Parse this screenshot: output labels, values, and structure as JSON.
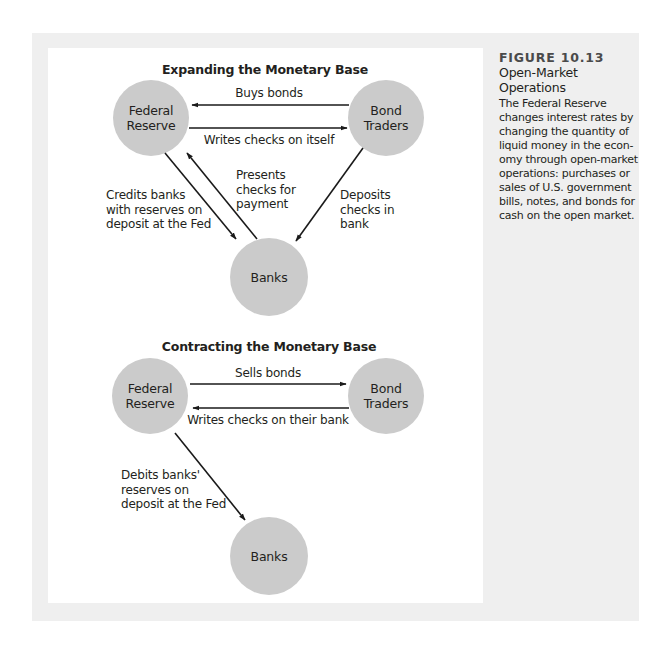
{
  "caption": {
    "figure_number": "FIGURE 10.13",
    "title_lines": [
      "Open-Market",
      "Operations"
    ],
    "body_lines": [
      "The Federal Reserve",
      "changes interest rates by",
      "changing the quantity of",
      "liquid money in the econ-",
      "omy through open-market",
      "operations: purchases or",
      "sales of U.S. government",
      "bills, notes, and bonds for",
      "cash on the open market."
    ]
  },
  "expanding": {
    "title": "Expanding the Monetary Base",
    "nodes": {
      "fed": [
        "Federal",
        "Reserve"
      ],
      "traders": [
        "Bond",
        "Traders"
      ],
      "banks": [
        "Banks"
      ]
    },
    "edges": {
      "buys_bonds": "Buys bonds",
      "writes_checks": "Writes checks on itself",
      "credits_banks": [
        "Credits banks",
        "with reserves on",
        "deposit at the Fed"
      ],
      "presents_checks": [
        "Presents",
        "checks for",
        "payment"
      ],
      "deposits_checks": [
        "Deposits",
        "checks in",
        "bank"
      ]
    }
  },
  "contracting": {
    "title": "Contracting the Monetary Base",
    "nodes": {
      "fed": [
        "Federal",
        "Reserve"
      ],
      "traders": [
        "Bond",
        "Traders"
      ],
      "banks": [
        "Banks"
      ]
    },
    "edges": {
      "sells_bonds": "Sells bonds",
      "writes_checks": "Writes checks on their bank",
      "debits_banks": [
        "Debits banks'",
        "reserves on",
        "deposit at the Fed"
      ]
    }
  },
  "colors": {
    "panel": "#efefef",
    "node_fill": "#cbcbcb",
    "arrow": "#1a1a1a"
  }
}
